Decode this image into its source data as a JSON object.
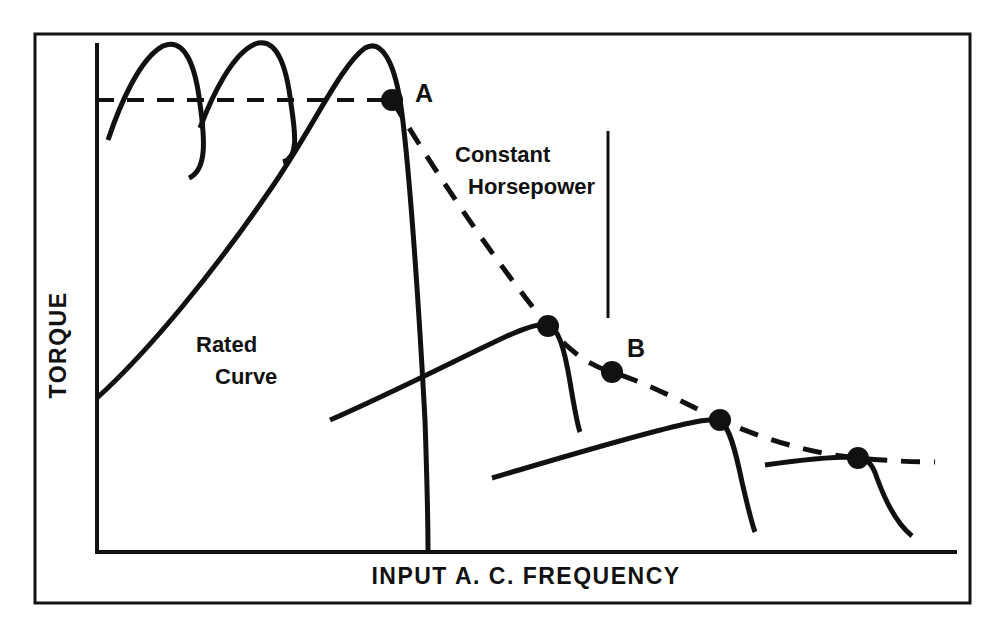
{
  "figure": {
    "background_color": "#ffffff",
    "ink_color": "#111111",
    "border": {
      "x": 35,
      "y": 34,
      "width": 935,
      "height": 569,
      "stroke_width": 3
    }
  },
  "chart_data": {
    "type": "line",
    "title": "",
    "xlabel": "INPUT  A. C.  FREQUENCY",
    "ylabel": "TORQUE",
    "grid": false,
    "legend": "none",
    "axes": {
      "x_axis": {
        "y": 552,
        "x_start": 97,
        "x_end": 955
      },
      "y_axis": {
        "x": 97,
        "y_start": 45,
        "y_end": 552
      },
      "stroke_width": 4,
      "tick_labels_x": [],
      "tick_labels_y": []
    },
    "annotations": [
      {
        "name": "point-a-label",
        "text": "A",
        "x": 415,
        "y": 102,
        "size": 25
      },
      {
        "name": "point-b-label",
        "text": "B",
        "x": 627,
        "y": 357,
        "size": 25
      },
      {
        "name": "rated-curve-label-line1",
        "text": "Rated",
        "x": 196,
        "y": 352,
        "size": 22
      },
      {
        "name": "rated-curve-label-line2",
        "text": "Curve",
        "x": 215,
        "y": 384,
        "size": 22
      },
      {
        "name": "constant-hp-label-line1",
        "text": "Constant",
        "x": 455,
        "y": 162,
        "size": 22
      },
      {
        "name": "constant-hp-label-line2",
        "text": "Horsepower",
        "x": 468,
        "y": 194,
        "size": 22
      }
    ],
    "leader_line": {
      "name": "constant-horsepower-leader",
      "x": 608,
      "y_start": 131,
      "y_end": 318,
      "stroke_width": 3
    },
    "rated_torque_dashed_level": {
      "name": "rated-torque-level",
      "y": 100,
      "x_start": 97,
      "x_end": 390,
      "dash": "17 13",
      "stroke_width": 4
    },
    "series": [
      {
        "name": "starting-torque-hump-1",
        "style": "solid",
        "stroke_width": 5,
        "path": "M 108,140 C 120,104 140,58 163,46 C 186,36 196,70 200,104 C 205,140 207,170 189,178"
      },
      {
        "name": "starting-torque-hump-2",
        "style": "solid",
        "stroke_width": 5,
        "path": "M 200,128 C 212,96 232,54 255,44 C 278,36 287,70 291,104 C 296,136 298,158 283,162"
      },
      {
        "name": "rated-curve-main",
        "style": "solid",
        "stroke_width": 5,
        "path": "M 97,398 C 150,350 215,270 270,190 C 312,130 340,66 365,48 C 382,38 394,64 400,100 C 408,150 418,290 425,420 C 427,480 428,520 428,552"
      },
      {
        "name": "field-weakened-curve-2",
        "style": "solid",
        "stroke_width": 5,
        "path": "M 330,420 C 390,394 460,358 505,337 C 527,327 541,323 548,325 C 558,328 564,346 570,382 C 574,406 577,424 580,432"
      },
      {
        "name": "field-weakened-curve-3",
        "style": "solid",
        "stroke_width": 5,
        "path": "M 492,478 C 560,458 646,432 690,423 C 707,419 716,419 721,422 C 729,427 735,448 742,482 C 748,508 752,524 755,532"
      },
      {
        "name": "field-weakened-curve-4",
        "style": "solid",
        "stroke_width": 5,
        "path": "M 765,465 C 800,460 836,457 852,457 C 866,457 872,462 877,478 C 885,500 897,524 912,536"
      },
      {
        "name": "constant-horsepower-envelope",
        "style": "dashed",
        "stroke_width": 5,
        "dash": "19 14",
        "path": "M 392,100 C 440,180 500,268 548,326 C 570,352 590,366 612,372 C 650,384 690,406 720,420 C 770,442 820,455 858,458 C 890,461 915,462 935,462"
      }
    ],
    "points": [
      {
        "name": "point-a",
        "label": "A",
        "x": 392,
        "y": 100,
        "r": 11
      },
      {
        "name": "peak-point-2",
        "x": 548,
        "y": 326,
        "r": 11
      },
      {
        "name": "point-b",
        "label": "B",
        "x": 612,
        "y": 372,
        "r": 11
      },
      {
        "name": "peak-point-3",
        "x": 720,
        "y": 420,
        "r": 11
      },
      {
        "name": "peak-point-4",
        "x": 858,
        "y": 458,
        "r": 11
      }
    ],
    "axis_label_positions": {
      "ylabel": {
        "x": 66,
        "y": 345,
        "size": 23,
        "rotation": -90,
        "letter_spacing": 1.5
      },
      "xlabel": {
        "x": 526,
        "y": 584,
        "size": 23,
        "letter_spacing": 1.5
      }
    }
  }
}
